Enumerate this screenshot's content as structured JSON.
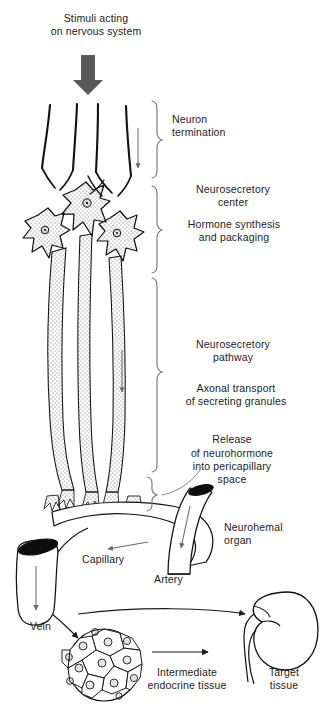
{
  "diagram": {
    "colors": {
      "ink": "#1a1a1a",
      "stipple": "#555555",
      "big_arrow_gray": "#5a5a5a",
      "thin_arrow_gray": "#6b6b6b",
      "background": "#ffffff"
    }
  },
  "labels": {
    "stimuli": "Stimuli acting\non nervous system",
    "neuron_termination": "Neuron\ntermination",
    "neurosecretory_center": "Neurosecretory\ncenter",
    "hormone_synthesis": "Hormone synthesis\nand packaging",
    "neurosecretory_pathway": "Neurosecretory\npathway",
    "axonal_transport": "Axonal transport\nof secreting granules",
    "release": "Release",
    "release_detail": "of neurohormone\ninto pericapillary\nspace",
    "neurohemal_organ": "Neurohemal\norgan",
    "capillary": "Capillary",
    "artery": "Artery",
    "vein": "Vein",
    "intermediate_endocrine": "Intermediate\nendocrine tissue",
    "target_tissue": "Target\ntissue"
  },
  "icons": {
    "stimulus_arrow": "down-arrow-thick-icon",
    "flow_arrow": "down-arrow-thin-icon",
    "brace": "curly-brace-icon",
    "neuron_soma": "neuron-cell-body-icon",
    "axon_tract": "axon-tract-icon",
    "capillary_vessel": "capillary-icon",
    "artery_vessel": "artery-icon",
    "vein_vessel": "vein-icon",
    "endocrine_cluster": "endocrine-cell-cluster-icon",
    "kidney": "kidney-icon"
  },
  "structures": {
    "neuron_count": 3,
    "axon_tract_count": 3,
    "endocrine_cell_count": 13,
    "brace_count": 4
  }
}
